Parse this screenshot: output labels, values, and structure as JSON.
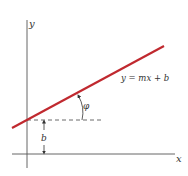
{
  "diagram": {
    "axes": {
      "x_label": "x",
      "y_label": "y"
    },
    "line": {
      "equation_label": "y = mx + b",
      "color": "#c0292f"
    },
    "angle": {
      "label": "φ"
    },
    "intercept": {
      "label": "b"
    },
    "colors": {
      "axis": "#555555",
      "dashed": "#444444",
      "text": "#333333",
      "background": "#ffffff"
    }
  }
}
